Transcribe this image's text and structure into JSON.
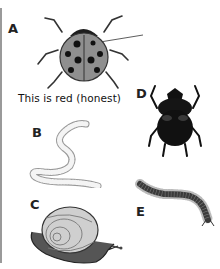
{
  "figure": {
    "panels": [
      {
        "letter": "A",
        "subject": "ladybug",
        "caption": "This is red (honest)"
      },
      {
        "letter": "B",
        "subject": "worm"
      },
      {
        "letter": "C",
        "subject": "snail"
      },
      {
        "letter": "D",
        "subject": "dung-beetle"
      },
      {
        "letter": "E",
        "subject": "millipede"
      }
    ]
  }
}
